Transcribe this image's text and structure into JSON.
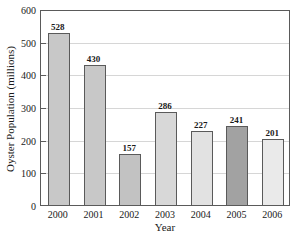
{
  "chart_data": {
    "type": "bar",
    "categories": [
      "2000",
      "2001",
      "2002",
      "2003",
      "2004",
      "2005",
      "2006"
    ],
    "values": [
      528,
      430,
      157,
      286,
      227,
      241,
      201
    ],
    "value_labels": [
      "528",
      "430",
      "157",
      "286",
      "227",
      "241",
      "201"
    ],
    "title": "",
    "xlabel": "Year",
    "ylabel": "Oyster Population (millions)",
    "ylim": [
      0,
      600
    ],
    "yticks": [
      0,
      100,
      200,
      300,
      400,
      500,
      600
    ],
    "grid": true,
    "legend": "none",
    "bar_colors": [
      "#c8c8c8",
      "#c8c8c8",
      "#c2c2c2",
      "#d8d8d8",
      "#e2e2e2",
      "#a2a2a2",
      "#eaeaea"
    ],
    "bar_border_color": "#5a5a5a",
    "grid_color": "#d6d6d6",
    "axis_color": "#5a5a5a",
    "text_color": "#1a1a1a"
  }
}
